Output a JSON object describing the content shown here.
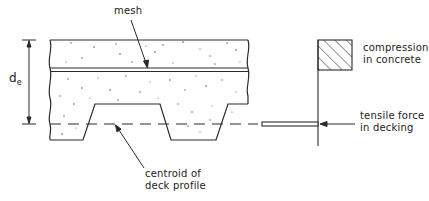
{
  "diagram": {
    "type": "structural section",
    "labels": {
      "mesh": "mesh",
      "depth_symbol": "d",
      "depth_subscript": "e",
      "compression_line1": "compression",
      "compression_line2": "in concrete",
      "tensile_line1": "tensile force",
      "tensile_line2": "in decking",
      "centroid_line1": "centroid of",
      "centroid_line2": "deck profile"
    },
    "colors": {
      "line": "#2a2a2a",
      "background": "#ffffff",
      "aggregate": "#555555"
    }
  }
}
